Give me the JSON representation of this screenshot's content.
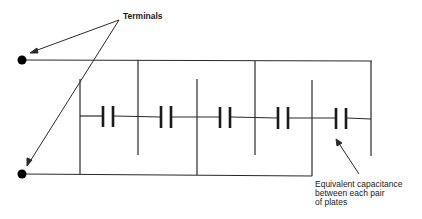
{
  "diagram": {
    "labels": {
      "terminals": "Terminals",
      "capacitance_line1": "Equivalent capacitance",
      "capacitance_line2": "between each pair",
      "capacitance_line3": "of plates"
    },
    "terminal_count": 2,
    "plate_count": 6,
    "capacitor_count": 5,
    "colors": {
      "line": "#2a2a2a",
      "background": "#ffffff"
    }
  }
}
